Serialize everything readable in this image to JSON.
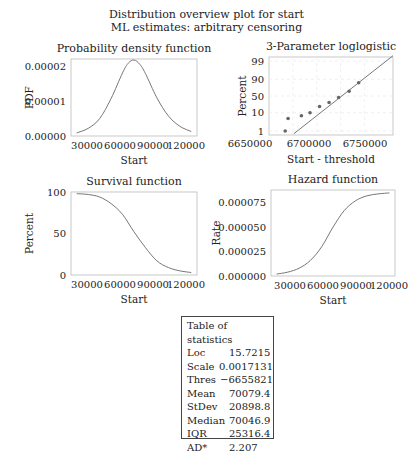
{
  "header": {
    "title": "Distribution overview plot for start",
    "subtitle": "ML estimates: arbitrary censoring"
  },
  "chart_data": [
    {
      "type": "line",
      "title": "Probability density function",
      "xlabel": "Start",
      "ylabel": "PDF",
      "xticks": [
        "30000",
        "60000",
        "90000",
        "120000"
      ],
      "yticks": [
        "0.00000",
        "0.00001",
        "0.00002"
      ],
      "xlim": [
        15000,
        125000
      ],
      "ylim": [
        0,
        2.22e-05
      ],
      "x": [
        20000,
        30000,
        40000,
        50000,
        60000,
        65000,
        70000,
        75000,
        80000,
        90000,
        100000,
        110000,
        120000
      ],
      "values": [
        9e-07,
        2.2e-06,
        5e-06,
        1.08e-05,
        1.82e-05,
        2.1e-05,
        2.19e-05,
        2.07e-05,
        1.8e-05,
        1.1e-05,
        5.8e-06,
        2.8e-06,
        1.3e-06
      ]
    },
    {
      "type": "scatter",
      "title": "3-Parameter loglogistic",
      "xlabel": "Start - threshold",
      "ylabel": "Percent",
      "xticks": [
        "6650000",
        "6700000",
        "6750000"
      ],
      "yticks": [
        "1",
        "10",
        "50",
        "90",
        "99"
      ],
      "xlim": [
        6650000,
        6780000
      ],
      "points": [
        {
          "x": 6667000,
          "y": 1
        },
        {
          "x": 6670000,
          "y": 5
        },
        {
          "x": 6684000,
          "y": 7
        },
        {
          "x": 6693000,
          "y": 10
        },
        {
          "x": 6703000,
          "y": 20
        },
        {
          "x": 6713000,
          "y": 30
        },
        {
          "x": 6723000,
          "y": 45
        },
        {
          "x": 6734000,
          "y": 65
        },
        {
          "x": 6744000,
          "y": 85
        }
      ],
      "fit_line": {
        "x": [
          6676000,
          6780000
        ],
        "y": [
          0.7,
          99.5
        ]
      }
    },
    {
      "type": "line",
      "title": "Survival function",
      "xlabel": "Start",
      "ylabel": "Percent",
      "xticks": [
        "30000",
        "60000",
        "90000",
        "120000"
      ],
      "yticks": [
        "0",
        "50",
        "100"
      ],
      "xlim": [
        15000,
        125000
      ],
      "ylim": [
        0,
        100
      ],
      "x": [
        20000,
        30000,
        40000,
        50000,
        60000,
        70000,
        80000,
        90000,
        100000,
        110000,
        120000
      ],
      "values": [
        98,
        97,
        94,
        86,
        73,
        52,
        33,
        17,
        9,
        5,
        3
      ]
    },
    {
      "type": "line",
      "title": "Hazard function",
      "xlabel": "Start",
      "ylabel": "Rate",
      "xticks": [
        "30000",
        "60000",
        "90000",
        "120000"
      ],
      "yticks": [
        "0.000000",
        "0.000025",
        "0.000050",
        "0.000075"
      ],
      "xlim": [
        15000,
        125000
      ],
      "ylim": [
        0,
        8.8e-05
      ],
      "x": [
        20000,
        30000,
        40000,
        50000,
        60000,
        70000,
        80000,
        90000,
        100000,
        110000,
        120000
      ],
      "values": [
        2e-06,
        4e-06,
        8e-06,
        1.6e-05,
        3e-05,
        5e-05,
        6.7e-05,
        7.7e-05,
        8.2e-05,
        8.4e-05,
        8.5e-05
      ]
    }
  ],
  "stats_table": {
    "title": "Table of statistics",
    "rows": [
      {
        "label": "Loc",
        "value": "15.7215"
      },
      {
        "label": "Scale",
        "value": "0.0017131"
      },
      {
        "label": "Thres",
        "value": "−6655821"
      },
      {
        "label": "Mean",
        "value": "70079.4"
      },
      {
        "label": "StDev",
        "value": "20898.8"
      },
      {
        "label": "Median",
        "value": "70046.9"
      },
      {
        "label": "IQR",
        "value": "25316.4"
      },
      {
        "label": "AD*",
        "value": "2.207"
      }
    ]
  }
}
